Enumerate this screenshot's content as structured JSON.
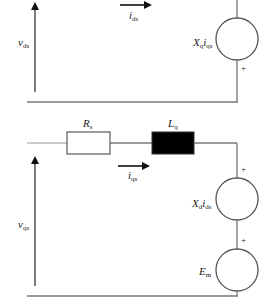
{
  "diagram": {
    "title": "",
    "d_axis_circuit": {
      "voltage_label": {
        "main": "v",
        "sub": "ds"
      },
      "current_label": {
        "main": "i",
        "sub": "ds"
      },
      "source_label": {
        "main1": "X",
        "sub1": "q",
        "main2": "i",
        "sub2": "qs"
      },
      "source_polarity": "+"
    },
    "q_axis_circuit": {
      "resistor_label": {
        "main": "R",
        "sub": "s"
      },
      "inductor_label": {
        "main": "L",
        "sub": "q"
      },
      "current_label": {
        "main": "i",
        "sub": "qs"
      },
      "voltage_label": {
        "main": "v",
        "sub": "qs"
      },
      "source1_label": {
        "main1": "X",
        "sub1": "d",
        "main2": "i",
        "sub2": "ds"
      },
      "source1_polarity": "+",
      "source2_label": {
        "main": "E",
        "sub": "m"
      },
      "source2_polarity": "+"
    },
    "colors": {
      "wire": "#777777",
      "arrow": "#111111",
      "inductor_fill": "#000000",
      "resistor_fill": "#ffffff"
    }
  }
}
